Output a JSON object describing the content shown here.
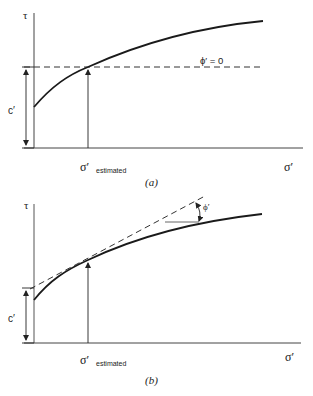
{
  "figures": [
    {
      "id": "a",
      "caption": "(a)",
      "y_axis_label": "τ",
      "x_axis_label": "σ′",
      "intercept_label": "c′",
      "sigma_label_main": "σ′",
      "sigma_label_sub": "estimated",
      "line_label": "ϕ′ = 0",
      "description": "Curved failure envelope with horizontal (ϕ′ = 0) line drawn at the shear strength corresponding to the estimated effective normal stress"
    },
    {
      "id": "b",
      "caption": "(b)",
      "y_axis_label": "τ",
      "x_axis_label": "σ′",
      "intercept_label": "c′",
      "sigma_label_main": "σ′",
      "sigma_label_sub": "estimated",
      "angle_label": "ϕ′",
      "description": "Curved failure envelope with straight-line tangent at the estimated effective normal stress giving c′ intercept and friction angle ϕ′"
    }
  ],
  "colors": {
    "line": "#1a1a1a",
    "axis": "#333333",
    "dashed": "#333333"
  }
}
